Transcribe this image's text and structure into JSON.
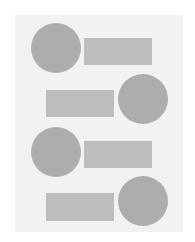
{
  "colors": {
    "background": "#ffffff",
    "panel": "#f2f2f2",
    "circle": "#adadad",
    "rectangle": "#bdbdbd"
  },
  "panel": {
    "x": 15,
    "y": 15,
    "width": 168,
    "height": 217
  },
  "rows": [
    {
      "circle": {
        "x": 31,
        "y": 23,
        "d": 50
      },
      "rect": {
        "x": 84,
        "y": 38,
        "width": 68,
        "height": 27
      }
    },
    {
      "rect": {
        "x": 46,
        "y": 90,
        "width": 68,
        "height": 27
      },
      "circle": {
        "x": 118,
        "y": 74,
        "d": 50
      }
    },
    {
      "circle": {
        "x": 31,
        "y": 127,
        "d": 50
      },
      "rect": {
        "x": 84,
        "y": 141,
        "width": 68,
        "height": 27
      }
    },
    {
      "rect": {
        "x": 46,
        "y": 193,
        "width": 68,
        "height": 28
      },
      "circle": {
        "x": 118,
        "y": 176,
        "d": 50
      }
    }
  ]
}
